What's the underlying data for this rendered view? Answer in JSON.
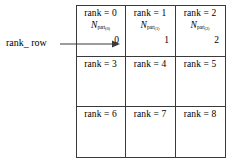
{
  "figure": {
    "annotation": {
      "label": "rank_ row",
      "arrow_icon": "right-arrow-icon"
    },
    "grid": {
      "rows": [
        {
          "cells": [
            {
              "rank": "rank = 0",
              "npart": {
                "base": "N",
                "sub": "part",
                "index": "(0)"
              },
              "value": "0"
            },
            {
              "rank": "rank = 1",
              "npart": {
                "base": "N",
                "sub": "part",
                "index": "(1)"
              },
              "value": "1"
            },
            {
              "rank": "rank = 2",
              "npart": {
                "base": "N",
                "sub": "part",
                "index": "(2)"
              },
              "value": "2"
            }
          ]
        },
        {
          "cells": [
            {
              "rank": "rank = 3"
            },
            {
              "rank": "rank = 4"
            },
            {
              "rank": "rank = 5"
            }
          ]
        },
        {
          "cells": [
            {
              "rank": "rank = 6"
            },
            {
              "rank": "rank = 7"
            },
            {
              "rank": "rank = 8"
            }
          ]
        }
      ]
    },
    "colors": {
      "border": "#3a3a3a",
      "text": "#000000",
      "background": "#ffffff"
    }
  }
}
